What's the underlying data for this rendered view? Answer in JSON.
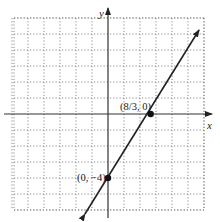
{
  "chart_data": {
    "type": "line",
    "title": "",
    "xlabel": "x",
    "ylabel": "y",
    "xlim": [
      -6,
      6
    ],
    "ylim": [
      -6,
      6
    ],
    "grid": true,
    "grid_style": "dotted",
    "equation": "y = (3/2)x - 4",
    "series": [
      {
        "name": "line",
        "x": [
          -1.44,
          5.69
        ],
        "y": [
          -6.25,
          5.25
        ]
      }
    ],
    "points": [
      {
        "label": "(8/3, 0)",
        "x": 2.667,
        "y": 0
      },
      {
        "label": "(0, −4)",
        "x": 0,
        "y": -4
      }
    ],
    "annotations": [
      "(8/3, 0)",
      "(0, −4)"
    ]
  },
  "labels": {
    "x_axis": "x",
    "y_axis": "y",
    "point_a": "(8/3, 0)",
    "point_b": "(0, −4)"
  },
  "colors": {
    "axis": "#333333",
    "grid": "#888888",
    "line": "#222222",
    "point": "#111111"
  }
}
